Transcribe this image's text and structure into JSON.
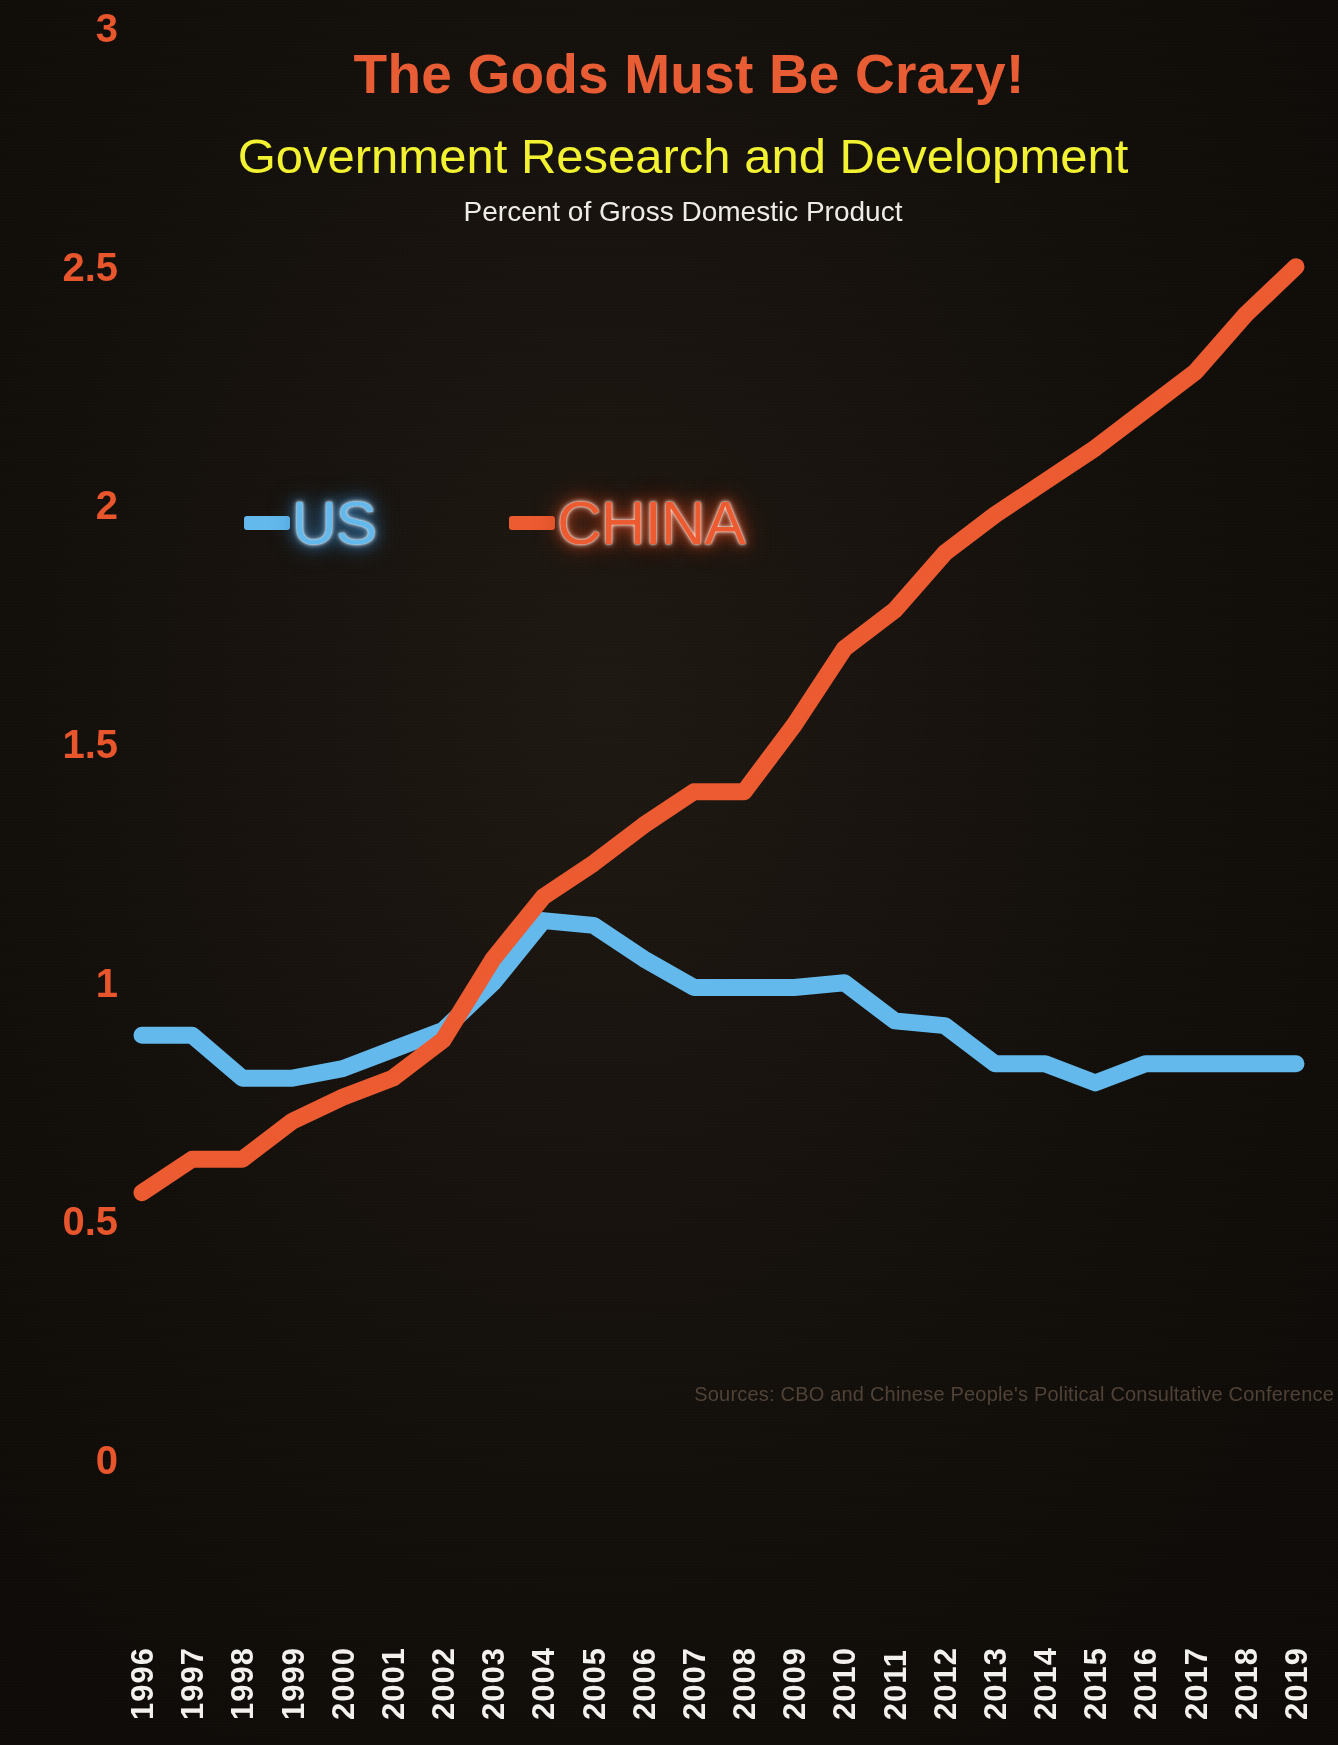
{
  "titles": {
    "main": "The Gods Must Be Crazy!",
    "sub": "Government Research and Development",
    "sub2": "Percent of Gross Domestic Product"
  },
  "source_note": "Sources: CBO and Chinese People's Political Consultative Conference",
  "colors": {
    "background": "#15100c",
    "title_main": "#e85c33",
    "title_sub": "#f2f230",
    "title_sub2": "#efece8",
    "axis_y_label": "#e8552b",
    "axis_x_label": "#f3f1ee",
    "us_line": "#63b8ec",
    "china_line": "#ec5a30",
    "source_note": "#5a4b3e"
  },
  "legend": {
    "position": "inside-top-left",
    "items": [
      {
        "label": "US",
        "color": "#63b8ec",
        "marker": "line-dash"
      },
      {
        "label": "CHINA",
        "color": "#ec5a30",
        "marker": "line-dash"
      }
    ]
  },
  "chart_data": {
    "type": "line",
    "title": "The Gods Must Be Crazy!",
    "subtitle": "Government Research and Development",
    "subtitle2": "Percent of Gross Domestic Product",
    "xlabel": "",
    "ylabel": "",
    "grid": false,
    "ylim": [
      0,
      3
    ],
    "yticks": [
      "0",
      "0.5",
      "1",
      "1.5",
      "2",
      "2.5",
      "3"
    ],
    "ytick_values": [
      0,
      0.5,
      1,
      1.5,
      2,
      2.5,
      3
    ],
    "categories": [
      "1996",
      "1997",
      "1998",
      "1999",
      "2000",
      "2001",
      "2002",
      "2003",
      "2004",
      "2005",
      "2006",
      "2007",
      "2008",
      "2009",
      "2010",
      "2011",
      "2012",
      "2013",
      "2014",
      "2015",
      "2016",
      "2017",
      "2018",
      "2019"
    ],
    "series": [
      {
        "name": "US",
        "color": "#63b8ec",
        "values": [
          0.89,
          0.89,
          0.8,
          0.8,
          0.82,
          0.86,
          0.9,
          1.0,
          1.13,
          1.12,
          1.05,
          0.99,
          0.99,
          0.99,
          1.0,
          0.92,
          0.91,
          0.83,
          0.83,
          0.79,
          0.83,
          0.83,
          0.83,
          0.83
        ]
      },
      {
        "name": "CHINA",
        "color": "#ec5a30",
        "values": [
          0.56,
          0.63,
          0.63,
          0.71,
          0.76,
          0.8,
          0.88,
          1.05,
          1.18,
          1.25,
          1.33,
          1.4,
          1.4,
          1.54,
          1.7,
          1.78,
          1.9,
          1.98,
          2.05,
          2.12,
          2.2,
          2.28,
          2.4,
          2.5
        ]
      }
    ],
    "annotations": [
      "Sources: CBO and Chinese People's Political Consultative Conference"
    ]
  }
}
